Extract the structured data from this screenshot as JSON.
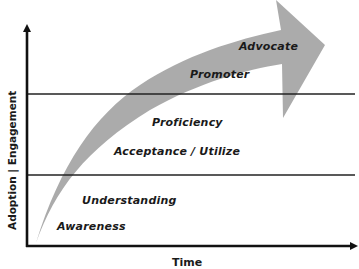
{
  "axes": {
    "y_label": "Adoption | Engagement",
    "x_label": "Time"
  },
  "stages": [
    {
      "id": "awareness",
      "label": "Awareness"
    },
    {
      "id": "understanding",
      "label": "Understanding"
    },
    {
      "id": "acceptance",
      "label": "Acceptance / Utilize"
    },
    {
      "id": "proficiency",
      "label": "Proficiency"
    },
    {
      "id": "promoter",
      "label": "Promoter"
    },
    {
      "id": "advocate",
      "label": "Advocate"
    }
  ],
  "colors": {
    "arrow_fill": "#a6a6a6",
    "axis": "#111111",
    "divider": "#222222",
    "text": "#1a1a1a"
  }
}
